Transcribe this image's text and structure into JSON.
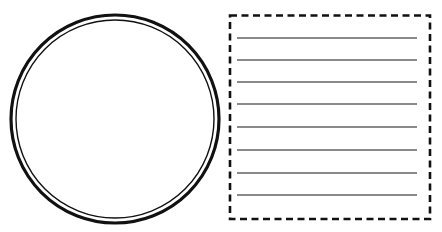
{
  "figure": {
    "circle": {
      "cx": 115,
      "cy": 119,
      "outer_r": 104,
      "outer_stroke": 3.2,
      "inner_r": 99,
      "inner_stroke": 1.4,
      "color": "#111111"
    },
    "lined_box": {
      "x": 230,
      "y": 15.5,
      "width": 200,
      "height": 203.5,
      "border_color": "#111111",
      "border_width": 2.6,
      "dash": "7 4.5",
      "line_color": "#8a8a8a",
      "line_width": 2,
      "line_x1": 237,
      "line_x2": 417,
      "lines_y": [
        38,
        60,
        82,
        104,
        127,
        150,
        173,
        195
      ]
    }
  }
}
